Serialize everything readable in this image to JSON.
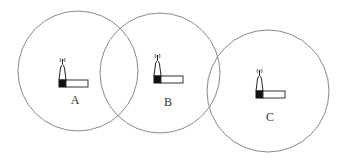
{
  "diagram": {
    "colors": {
      "circle_stroke": "#8a8a8a",
      "tower_base": "#111111",
      "background": "#ffffff"
    },
    "stations": [
      {
        "id": "A",
        "label": "A",
        "circle": {
          "cx": 78,
          "cy": 71,
          "r": 60
        },
        "icon": {
          "x": 59,
          "y": 58
        },
        "label_pos": {
          "x": 75,
          "y": 104
        }
      },
      {
        "id": "B",
        "label": "B",
        "circle": {
          "cx": 160,
          "cy": 73,
          "r": 60
        },
        "icon": {
          "x": 154,
          "y": 54
        },
        "label_pos": {
          "x": 168,
          "y": 106
        }
      },
      {
        "id": "C",
        "label": "C",
        "circle": {
          "cx": 268,
          "cy": 91,
          "r": 61
        },
        "icon": {
          "x": 256,
          "y": 69
        },
        "label_pos": {
          "x": 270,
          "y": 121
        }
      }
    ]
  }
}
